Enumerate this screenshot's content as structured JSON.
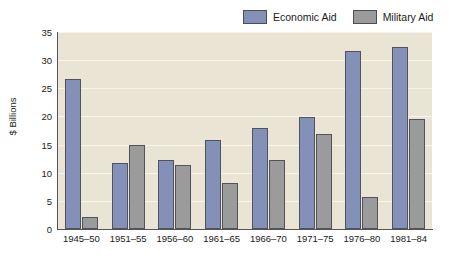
{
  "chart_data": {
    "type": "bar",
    "title": "",
    "subtitle": "",
    "xlabel": "",
    "ylabel": "$ Billions",
    "ylim": [
      0,
      35
    ],
    "yticks": [
      0,
      5,
      10,
      15,
      20,
      25,
      30,
      35
    ],
    "ytick_labels": [
      "0",
      "5",
      "10",
      "15",
      "20",
      "25",
      "30",
      "35"
    ],
    "grid": true,
    "grid_axis": "y",
    "legend_position": "top-right",
    "categories": [
      "1945–50",
      "1951–55",
      "1956–60",
      "1961–65",
      "1966–70",
      "1971–75",
      "1976–80",
      "1981–84"
    ],
    "series": [
      {
        "name": "Economic Aid",
        "color": "#8390b8",
        "values": [
          26.7,
          11.7,
          12.2,
          15.8,
          18.0,
          19.9,
          31.7,
          32.3
        ]
      },
      {
        "name": "Military Aid",
        "color": "#9b9b9b",
        "values": [
          2.2,
          14.9,
          11.3,
          8.1,
          12.3,
          16.8,
          5.7,
          19.6
        ]
      }
    ],
    "plot_background": "#e9e4d4",
    "bar_border_color": "#52525c",
    "axis_color": "#555555",
    "gridline_color": "#f7f4e9"
  },
  "legend": {
    "items": [
      {
        "label": "Economic Aid",
        "swatch": "#8390b8"
      },
      {
        "label": "Military Aid",
        "swatch": "#9b9b9b"
      }
    ]
  }
}
